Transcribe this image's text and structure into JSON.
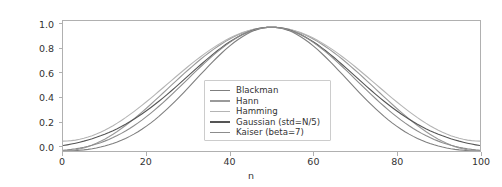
{
  "chart_data": {
    "type": "line",
    "title": "",
    "xlabel": "n",
    "ylabel": "",
    "xlim": [
      0,
      100
    ],
    "ylim": [
      0.0,
      1.05
    ],
    "grid": false,
    "legend_position": "center",
    "xticks": [
      0,
      20,
      40,
      60,
      80,
      100
    ],
    "xtick_labels": [
      "0",
      "20",
      "40",
      "60",
      "80",
      "100"
    ],
    "yticks": [
      0.0,
      0.2,
      0.4,
      0.6,
      0.8,
      1.0
    ],
    "ytick_labels": [
      "0.0",
      "0.2",
      "0.4",
      "0.6",
      "0.8",
      "1.0"
    ],
    "x": [
      0,
      2,
      4,
      6,
      8,
      10,
      12,
      14,
      16,
      18,
      20,
      22,
      24,
      26,
      28,
      30,
      32,
      34,
      36,
      38,
      40,
      42,
      44,
      46,
      48,
      50,
      52,
      54,
      56,
      58,
      60,
      62,
      64,
      66,
      68,
      70,
      72,
      74,
      76,
      78,
      80,
      82,
      84,
      86,
      88,
      90,
      92,
      94,
      96,
      98,
      100
    ],
    "series": [
      {
        "name": "Blackman",
        "color": "#7f7f7f",
        "values": [
          0.0,
          0.003,
          0.011,
          0.026,
          0.047,
          0.075,
          0.111,
          0.154,
          0.204,
          0.262,
          0.326,
          0.396,
          0.47,
          0.547,
          0.626,
          0.704,
          0.779,
          0.849,
          0.91,
          0.96,
          0.991,
          1.0,
          0.991,
          0.96,
          0.91,
          0.849,
          0.779,
          0.704,
          0.626,
          0.547,
          0.47,
          0.396,
          0.326,
          0.262,
          0.204,
          0.154,
          0.111,
          0.075,
          0.047,
          0.026,
          0.011,
          0.003,
          0.0,
          0.0,
          0.0,
          0.0,
          0.0,
          0.0,
          0.0,
          0.0,
          0.0
        ]
      },
      {
        "name": "Hann",
        "color": "#9a9a9a",
        "values": [
          0.0,
          0.001,
          0.004,
          0.009,
          0.016,
          0.025,
          0.036,
          0.049,
          0.065,
          0.083,
          0.103,
          0.125,
          0.149,
          0.175,
          0.202,
          0.231,
          0.261,
          0.293,
          0.325,
          0.359,
          0.393,
          0.427,
          0.462,
          0.497,
          0.532,
          0.566,
          0.6,
          0.634,
          0.667,
          0.699,
          0.73,
          0.76,
          0.789,
          0.816,
          0.842,
          0.866,
          0.888,
          0.908,
          0.927,
          0.943,
          0.957,
          0.968,
          0.978,
          0.986,
          0.991,
          0.994,
          0.996,
          0.999,
          1.0,
          0.999,
          0.996
        ]
      },
      {
        "name": "Hamming",
        "color": "#b4b4b4",
        "values": [
          0.08,
          0.082,
          0.088,
          0.098,
          0.112,
          0.13,
          0.152,
          0.177,
          0.206,
          0.238,
          0.273,
          0.311,
          0.351,
          0.393,
          0.437,
          0.482,
          0.528,
          0.575,
          0.621,
          0.667,
          0.712,
          0.755,
          0.797,
          0.836,
          0.872,
          0.905,
          0.934,
          0.959,
          0.979,
          0.993,
          1.0,
          0.993,
          0.979,
          0.959,
          0.934,
          0.905,
          0.872,
          0.836,
          0.797,
          0.755,
          0.712,
          0.667,
          0.621,
          0.575,
          0.528,
          0.482,
          0.437,
          0.393,
          0.351,
          0.311,
          0.273
        ]
      },
      {
        "name": "Gaussian (std=N/5)",
        "color": "#555555",
        "values": [
          0.044,
          0.061,
          0.082,
          0.109,
          0.141,
          0.18,
          0.226,
          0.278,
          0.337,
          0.402,
          0.472,
          0.545,
          0.619,
          0.692,
          0.761,
          0.825,
          0.88,
          0.925,
          0.96,
          0.983,
          0.996,
          1.0,
          0.996,
          0.983,
          0.96,
          0.925,
          0.88,
          0.825,
          0.761,
          0.692,
          0.619,
          0.545,
          0.472,
          0.402,
          0.337,
          0.278,
          0.226,
          0.18,
          0.141,
          0.109,
          0.082,
          0.061,
          0.044,
          0.031,
          0.022,
          0.015,
          0.01,
          0.006,
          0.004,
          0.002,
          0.001
        ]
      },
      {
        "name": "Kaiser (beta=7)",
        "color": "#8c8c8c",
        "values": [
          0.002,
          0.006,
          0.013,
          0.025,
          0.042,
          0.066,
          0.097,
          0.136,
          0.183,
          0.238,
          0.301,
          0.371,
          0.446,
          0.525,
          0.606,
          0.687,
          0.765,
          0.838,
          0.901,
          0.953,
          0.988,
          1.0,
          0.988,
          0.953,
          0.901,
          0.838,
          0.765,
          0.687,
          0.606,
          0.525,
          0.446,
          0.371,
          0.301,
          0.238,
          0.183,
          0.136,
          0.097,
          0.066,
          0.042,
          0.025,
          0.013,
          0.006,
          0.002,
          0.001,
          0.0,
          0.0,
          0.0,
          0.0,
          0.0,
          0.0,
          0.0
        ]
      }
    ]
  },
  "axes": {
    "spine_color": "#b0b0b0",
    "tick_color": "#333333",
    "background": "#ffffff"
  },
  "legend": {
    "items": [
      {
        "label": "Blackman"
      },
      {
        "label": "Hann"
      },
      {
        "label": "Hamming"
      },
      {
        "label": "Gaussian (std=N/5)"
      },
      {
        "label": "Kaiser (beta=7)"
      }
    ]
  },
  "ylabels": {
    "t0": "0.0",
    "t1": "0.2",
    "t2": "0.4",
    "t3": "0.6",
    "t4": "0.8",
    "t5": "1.0"
  },
  "xlabels": {
    "t0": "0",
    "t1": "20",
    "t2": "40",
    "t3": "60",
    "t4": "80",
    "t5": "100"
  },
  "axis_title": {
    "x": "n"
  }
}
